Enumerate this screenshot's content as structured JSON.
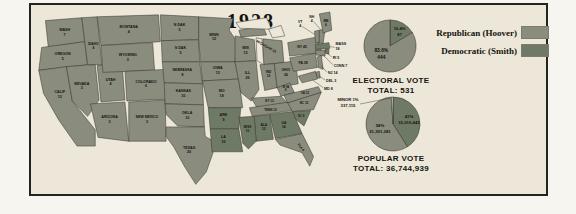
{
  "title": "1928",
  "colors": {
    "republican": "#8a8c7e",
    "democratic": "#6f7a66",
    "minor": "#ded9c8",
    "water": "#ece7d8",
    "panel_bg": "#ece7d8",
    "ink": "#15140e"
  },
  "legend": {
    "items": [
      {
        "id": "republican",
        "label": "Republican (Hoover)"
      },
      {
        "id": "democratic",
        "label": "Democratic (Smith)"
      }
    ]
  },
  "electoral": {
    "title_line1": "ELECTORAL VOTE",
    "title_line2": "TOTAL: 531",
    "total": 531,
    "slices": [
      {
        "id": "dem",
        "party": "democratic",
        "pct": 16.4,
        "pct_label": "16.4%",
        "value_label": "87"
      },
      {
        "id": "rep",
        "party": "republican",
        "pct": 83.6,
        "pct_label": "83.6%",
        "value_label": "444"
      }
    ]
  },
  "popular": {
    "title_line1": "POPULAR VOTE",
    "title_line2": "TOTAL: 36,744,939",
    "total": "36,744,939",
    "slices": [
      {
        "id": "dem",
        "party": "democratic",
        "pct": 41,
        "pct_label": "41%",
        "value_label": "15,016,443"
      },
      {
        "id": "rep",
        "party": "republican",
        "pct": 58,
        "pct_label": "58%",
        "value_label": "21,391,381"
      },
      {
        "id": "minor",
        "party": "minor",
        "pct": 1,
        "pct_label": "MINOR 1%",
        "value_label": "337,115"
      }
    ]
  },
  "map": {
    "states": [
      {
        "id": "WASH",
        "name": "WASH",
        "ev": "7",
        "party": "republican"
      },
      {
        "id": "ORE",
        "name": "OREGON",
        "ev": "5",
        "party": "republican"
      },
      {
        "id": "CALIF",
        "name": "CALIF",
        "ev": "13",
        "party": "republican"
      },
      {
        "id": "IDAHO",
        "name": "IDAHO",
        "ev": "4",
        "party": "republican"
      },
      {
        "id": "NEV",
        "name": "NEVADA",
        "ev": "3",
        "party": "republican"
      },
      {
        "id": "UTAH",
        "name": "UTAH",
        "ev": "4",
        "party": "republican"
      },
      {
        "id": "MONT",
        "name": "MONTANA",
        "ev": "4",
        "party": "republican"
      },
      {
        "id": "WYO",
        "name": "WYOMING",
        "ev": "3",
        "party": "republican"
      },
      {
        "id": "COLO",
        "name": "COLORADO",
        "ev": "6",
        "party": "republican"
      },
      {
        "id": "ARIZ",
        "name": "ARIZONA",
        "ev": "3",
        "party": "republican"
      },
      {
        "id": "NMEX",
        "name": "NEW MEXICO",
        "ev": "3",
        "party": "republican"
      },
      {
        "id": "NDAK",
        "name": "N DAK",
        "ev": "5",
        "party": "republican"
      },
      {
        "id": "SDAK",
        "name": "S DAK",
        "ev": "5",
        "party": "republican"
      },
      {
        "id": "NEB",
        "name": "NEBRASKA",
        "ev": "8",
        "party": "republican"
      },
      {
        "id": "KAN",
        "name": "KANSAS",
        "ev": "10",
        "party": "republican"
      },
      {
        "id": "OKLA",
        "name": "OKLA",
        "ev": "10",
        "party": "republican"
      },
      {
        "id": "TEX",
        "name": "TEXAS",
        "ev": "20",
        "party": "republican"
      },
      {
        "id": "MINN",
        "name": "MINN",
        "ev": "12",
        "party": "republican"
      },
      {
        "id": "IOWA",
        "name": "IOWA",
        "ev": "13",
        "party": "republican"
      },
      {
        "id": "MO",
        "name": "MO",
        "ev": "18",
        "party": "republican"
      },
      {
        "id": "ARK",
        "name": "ARK",
        "ev": "9",
        "party": "democratic"
      },
      {
        "id": "LA",
        "name": "LA",
        "ev": "10",
        "party": "democratic"
      },
      {
        "id": "WIS",
        "name": "WIS",
        "ev": "13",
        "party": "republican"
      },
      {
        "id": "ILL",
        "name": "ILL",
        "ev": "29",
        "party": "republican"
      },
      {
        "id": "MICH",
        "name": "MICHIGAN",
        "ev": "15",
        "party": "republican"
      },
      {
        "id": "IND",
        "name": "IND",
        "ev": "15",
        "party": "republican"
      },
      {
        "id": "OHIO",
        "name": "OHIO",
        "ev": "24",
        "party": "republican"
      },
      {
        "id": "WVA",
        "name": "W VA",
        "ev": "8",
        "party": "republican"
      },
      {
        "id": "KY",
        "name": "KY",
        "ev": "13",
        "party": "republican"
      },
      {
        "id": "TENN",
        "name": "TENN",
        "ev": "12",
        "party": "republican"
      },
      {
        "id": "VA",
        "name": "VA",
        "ev": "12",
        "party": "republican"
      },
      {
        "id": "NC",
        "name": "NC",
        "ev": "12",
        "party": "republican"
      },
      {
        "id": "SC",
        "name": "SC",
        "ev": "9",
        "party": "democratic"
      },
      {
        "id": "GA",
        "name": "GA",
        "ev": "14",
        "party": "democratic"
      },
      {
        "id": "ALA",
        "name": "ALA",
        "ev": "12",
        "party": "democratic"
      },
      {
        "id": "MISS",
        "name": "MISS",
        "ev": "10",
        "party": "democratic"
      },
      {
        "id": "FLA",
        "name": "FLA",
        "ev": "6",
        "party": "republican"
      },
      {
        "id": "PA",
        "name": "PA",
        "ev": "38",
        "party": "republican"
      },
      {
        "id": "NY",
        "name": "NY",
        "ev": "45",
        "party": "republican"
      },
      {
        "id": "NJ",
        "name": "NJ",
        "ev": "14",
        "party": "republican"
      },
      {
        "id": "DEL",
        "name": "DEL",
        "ev": "3",
        "party": "republican"
      },
      {
        "id": "MD",
        "name": "MD",
        "ev": "8",
        "party": "republican"
      },
      {
        "id": "VT",
        "name": "VT",
        "ev": "4",
        "party": "republican"
      },
      {
        "id": "NH",
        "name": "NH",
        "ev": "4",
        "party": "republican"
      },
      {
        "id": "ME",
        "name": "ME",
        "ev": "6",
        "party": "republican"
      },
      {
        "id": "MASS",
        "name": "MASS",
        "ev": "18",
        "party": "democratic"
      },
      {
        "id": "RI",
        "name": "RI",
        "ev": "5",
        "party": "democratic"
      },
      {
        "id": "CONN",
        "name": "CONN",
        "ev": "7",
        "party": "republican"
      }
    ]
  },
  "chart_data": [
    {
      "type": "pie",
      "title": "ELECTORAL VOTE",
      "subtitle": "TOTAL: 531",
      "total": 531,
      "slices": [
        {
          "name": "Republican (Hoover)",
          "value": 444,
          "pct": 83.6
        },
        {
          "name": "Democratic (Smith)",
          "value": 87,
          "pct": 16.4
        }
      ]
    },
    {
      "type": "pie",
      "title": "POPULAR VOTE",
      "subtitle": "TOTAL: 36,744,939",
      "total": 36744939,
      "slices": [
        {
          "name": "Republican (Hoover)",
          "value": 21391381,
          "pct": 58
        },
        {
          "name": "Democratic (Smith)",
          "value": 15016443,
          "pct": 41
        },
        {
          "name": "Minor",
          "value": 337115,
          "pct": 1
        }
      ]
    }
  ]
}
